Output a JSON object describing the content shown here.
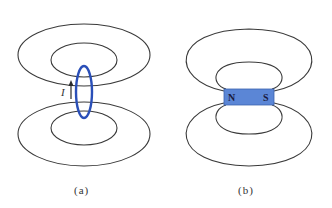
{
  "panels": [
    {
      "id": "a",
      "caption": "(a)",
      "subject": "current loop",
      "current_label": "I",
      "loop_color": "#2a4fb8",
      "line_color": "#3a3a3a"
    },
    {
      "id": "b",
      "caption": "(b)",
      "subject": "bar magnet",
      "north_label": "N",
      "south_label": "S",
      "magnet_color": "#5b86d6",
      "line_color": "#3a3a3a"
    }
  ]
}
